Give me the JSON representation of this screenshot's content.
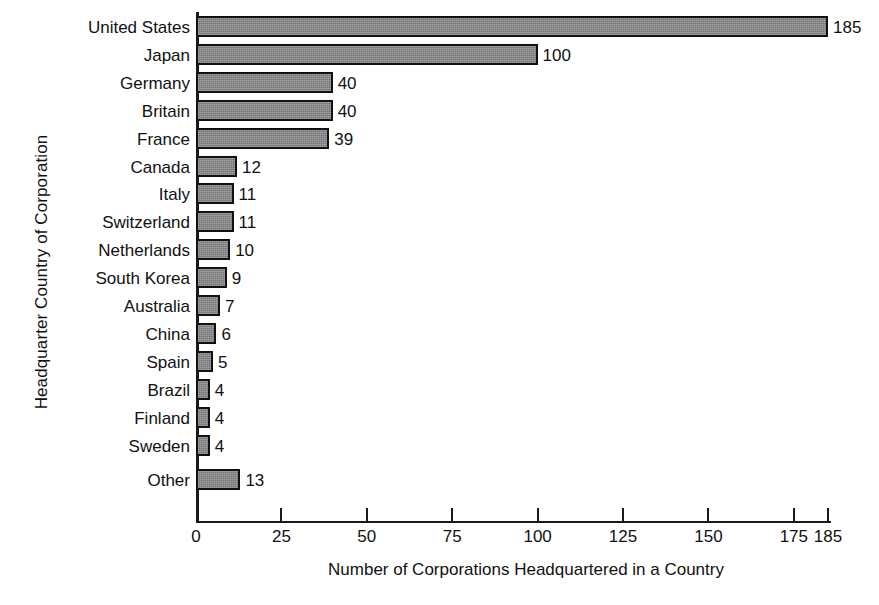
{
  "chart_data": {
    "type": "bar",
    "orientation": "horizontal",
    "title": "",
    "xlabel": "Number of Corporations Headquartered in a Country",
    "ylabel": "Headquarter Country of Corporation",
    "categories": [
      "United States",
      "Japan",
      "Germany",
      "Britain",
      "France",
      "Canada",
      "Italy",
      "Switzerland",
      "Netherlands",
      "South Korea",
      "Australia",
      "China",
      "Spain",
      "Brazil",
      "Finland",
      "Sweden",
      "Other"
    ],
    "values": [
      185,
      100,
      40,
      40,
      39,
      12,
      11,
      11,
      10,
      9,
      7,
      6,
      5,
      4,
      4,
      4,
      13
    ],
    "value_labels": [
      "185",
      "100",
      "40",
      "40",
      "39",
      "12",
      "11",
      "11",
      "10",
      "9",
      "7",
      "6",
      "5",
      "4",
      "4",
      "4",
      "13"
    ],
    "xticks": [
      0,
      25,
      50,
      75,
      100,
      125,
      150,
      175,
      185
    ],
    "xtick_labels": [
      "0",
      "25",
      "50",
      "75",
      "100",
      "125",
      "150",
      "175",
      "185"
    ],
    "xlim": [
      0,
      185
    ],
    "grid": false,
    "legend": null,
    "bar_color": "#858585",
    "bar_edge_color": "#111111",
    "background_color": "#ffffff",
    "axis_color": "#1a1a1a"
  }
}
